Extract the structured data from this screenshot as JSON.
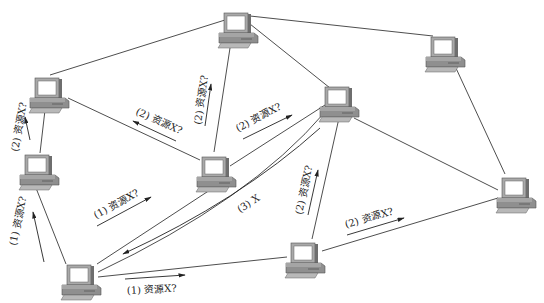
{
  "diagram": {
    "title": "",
    "nodes": [
      {
        "id": "n1",
        "x": 237,
        "y": 28,
        "kind": "computer"
      },
      {
        "id": "n2",
        "x": 48,
        "y": 93,
        "kind": "computer"
      },
      {
        "id": "n3",
        "x": 38,
        "y": 170,
        "kind": "computer"
      },
      {
        "id": "n4",
        "x": 215,
        "y": 172,
        "kind": "computer"
      },
      {
        "id": "n5",
        "x": 338,
        "y": 102,
        "kind": "computer"
      },
      {
        "id": "n6",
        "x": 444,
        "y": 52,
        "kind": "computer"
      },
      {
        "id": "n7",
        "x": 515,
        "y": 193,
        "kind": "computer"
      },
      {
        "id": "n8",
        "x": 304,
        "y": 258,
        "kind": "computer"
      },
      {
        "id": "n9",
        "x": 80,
        "y": 280,
        "kind": "computer"
      }
    ],
    "labels": {
      "n9_n3": "(1) 资源X?",
      "n9_n4": "(1) 资源X?",
      "n9_n8": "(1) 资源X?",
      "n3_n2": "(2) 资源X?",
      "n4_n2": "(2) 资源X?",
      "n4_n1": "(2) 资源X?",
      "n4_n5": "(2) 资源X?",
      "n8_n5": "(2) 资源X?",
      "n8_n7": "(2) 资源X?",
      "n5_n9_reply": "(3) X"
    },
    "colors": {
      "line": "#3a3a3a",
      "monitor_frame": "#a8a8a8",
      "monitor_screen": "#ffffff",
      "case": "#8c8c8c",
      "keyboard": "#b0b0b0"
    }
  }
}
